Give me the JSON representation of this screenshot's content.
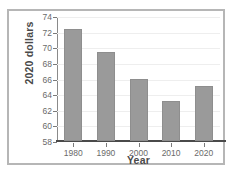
{
  "chart_data": {
    "type": "bar",
    "title": "",
    "subtitle": "",
    "xlabel": "Year",
    "ylabel": "2020 dollars",
    "categories": [
      "1980",
      "1990",
      "2000",
      "2010",
      "2020"
    ],
    "values": [
      72.3,
      69.4,
      66.0,
      63.1,
      65.0
    ],
    "ylim": [
      58,
      74
    ],
    "yticks": [
      58,
      60,
      62,
      64,
      66,
      68,
      70,
      72,
      74
    ],
    "ytick_labels": [
      "58",
      "60",
      "62",
      "64",
      "66",
      "68",
      "70",
      "72",
      "74"
    ],
    "xtick_labels": [
      "1980",
      "1990",
      "2000",
      "2010",
      "2020"
    ],
    "grid": true,
    "legend": null,
    "bar_color": "#9a9a9a",
    "axis_color": "#4a4a4a",
    "grid_color": "#eeeeee",
    "frame_color": "#b6b6b6"
  }
}
